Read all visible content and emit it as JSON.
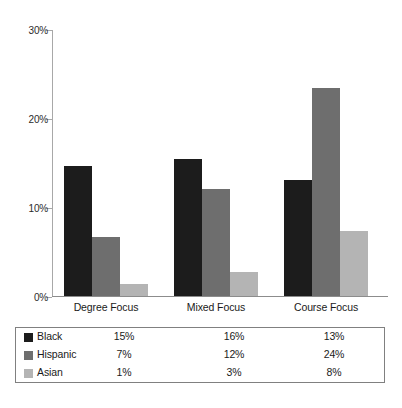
{
  "chart_data": {
    "type": "bar",
    "title": "",
    "subtitle": "",
    "xlabel": "",
    "ylabel": "",
    "categories": [
      "Degree Focus",
      "Mixed Focus",
      "Course Focus"
    ],
    "series": [
      {
        "name": "Black",
        "color": "#1c1c1c",
        "values": [
          15,
          16,
          13
        ],
        "plotted": [
          14.7,
          15.4,
          13.1
        ]
      },
      {
        "name": "Hispanic",
        "color": "#6e6e6e",
        "values": [
          7,
          12,
          24
        ],
        "plotted": [
          6.6,
          12.1,
          23.5
        ]
      },
      {
        "name": "Asian",
        "color": "#b4b4b4",
        "values": [
          1,
          3,
          8
        ],
        "plotted": [
          1.3,
          2.7,
          7.3
        ]
      }
    ],
    "value_suffix": "%",
    "ylim": [
      0,
      30
    ],
    "y_ticks": [
      0,
      10,
      20,
      30
    ],
    "y_tick_labels": [
      "0%",
      "10%",
      "20%",
      "30%"
    ],
    "grid": false,
    "legend_position": "bottom-table",
    "legend_rows": [
      {
        "name": "Black",
        "cells": [
          "15%",
          "7%",
          "1%"
        ]
      },
      {
        "name": "Hispanic",
        "cells": [
          "16%",
          "12%",
          "3%"
        ]
      },
      {
        "name": "Asian",
        "cells": [
          "13%",
          "24%",
          "8%"
        ]
      }
    ],
    "table": {
      "rows": [
        {
          "label": "Black",
          "values": [
            "15%",
            "16%",
            "13%"
          ]
        },
        {
          "label": "Hispanic",
          "values": [
            "7%",
            "12%",
            "24%"
          ]
        },
        {
          "label": "Asian",
          "values": [
            "1%",
            "3%",
            "8%"
          ]
        }
      ]
    }
  }
}
